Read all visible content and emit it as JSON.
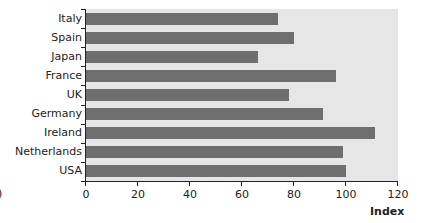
{
  "chart_data": {
    "type": "bar",
    "orientation": "horizontal",
    "title": "",
    "xlabel": "Index",
    "ylabel": "",
    "xlim": [
      0,
      120
    ],
    "xticks": [
      0,
      20,
      40,
      60,
      80,
      100,
      120
    ],
    "categories": [
      "Italy",
      "Spain",
      "Japan",
      "France",
      "UK",
      "Germany",
      "Ireland",
      "Netherlands",
      "USA"
    ],
    "values": [
      74,
      80,
      66,
      96,
      78,
      91,
      111,
      99,
      100
    ],
    "grid": false,
    "legend": null,
    "colors": {
      "bar": "#6e6e6e",
      "plot_background": "#e6e6e6"
    }
  },
  "edge_glyph": ")"
}
